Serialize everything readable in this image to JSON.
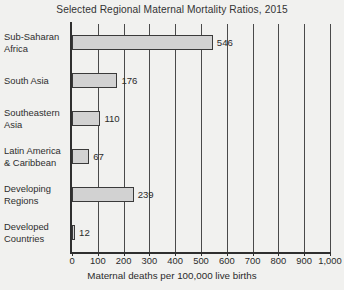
{
  "chart_data": {
    "type": "bar",
    "orientation": "horizontal",
    "title": "Selected Regional Maternal Mortality Ratios, 2015",
    "xlabel": "Maternal deaths per 100,000 live births",
    "ylabel": "",
    "xlim": [
      0,
      1000
    ],
    "grid": true,
    "legend": "none",
    "tick_labels": [
      "0",
      "100",
      "200",
      "300",
      "400",
      "500",
      "600",
      "700",
      "800",
      "900",
      "1,000"
    ],
    "tick_values": [
      0,
      100,
      200,
      300,
      400,
      500,
      600,
      700,
      800,
      900,
      1000
    ],
    "categories": [
      "Sub-Saharan Africa",
      "South Asia",
      "Southeastern Asia",
      "Latin America & Caribbean",
      "Developing Regions",
      "Developed Countries"
    ],
    "values": [
      546,
      176,
      110,
      67,
      239,
      12
    ],
    "bars": [
      {
        "label_lines": [
          "Sub-Saharan",
          "Africa"
        ],
        "value": 546,
        "value_label": "546"
      },
      {
        "label_lines": [
          "South Asia"
        ],
        "value": 176,
        "value_label": "176"
      },
      {
        "label_lines": [
          "Southeastern",
          "Asia"
        ],
        "value": 110,
        "value_label": "110"
      },
      {
        "label_lines": [
          "Latin America",
          "& Caribbean"
        ],
        "value": 67,
        "value_label": "67"
      },
      {
        "label_lines": [
          "Developing",
          "Regions"
        ],
        "value": 239,
        "value_label": "239"
      },
      {
        "label_lines": [
          "Developed",
          "Countries"
        ],
        "value": 12,
        "value_label": "12"
      }
    ],
    "colors": {
      "bar_fill": "#d2d2d2",
      "bar_border": "#3a3a3a",
      "background": "#f1f1ef",
      "axis": "#2f2f2f",
      "gridline": "#4a4a4a",
      "text": "#2b2b2b"
    }
  }
}
